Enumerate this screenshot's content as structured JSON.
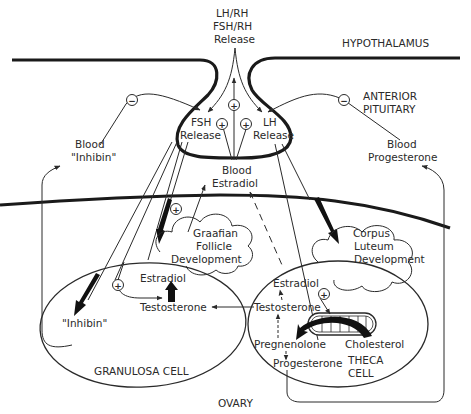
{
  "diagram": {
    "regions": {
      "hypothalamus": "HYPOTHALAMUS",
      "anterior_pituitary_line1": "ANTERIOR",
      "anterior_pituitary_line2": "PITUITARY",
      "ovary": "OVARY"
    },
    "hypothalamus_release": {
      "line1": "LH/RH",
      "line2": "FSH/RH",
      "line3": "Release"
    },
    "pituitary": {
      "fsh_line1": "FSH",
      "fsh_line2": "Release",
      "lh_line1": "LH",
      "lh_line2": "Release"
    },
    "blood": {
      "inhibin_line1": "Blood",
      "inhibin_line2": "\"Inhibin\"",
      "estradiol_line1": "Blood",
      "estradiol_line2": "Estradiol",
      "progesterone_line1": "Blood",
      "progesterone_line2": "Progesterone"
    },
    "follicle": {
      "line1": "Graafian",
      "line2": "Follicle",
      "line3": "Development"
    },
    "corpus_luteum": {
      "line1": "Corpus",
      "line2": "Luteum",
      "line3": "Development"
    },
    "granulosa_cell": {
      "label": "GRANULOSA CELL",
      "estradiol": "Estradiol",
      "testosterone": "Testosterone",
      "inhibin": "\"Inhibin\""
    },
    "theca_cell": {
      "label_line1": "THECA",
      "label_line2": "CELL",
      "estradiol": "Estradiol",
      "testosterone": "Testosterone",
      "pregnenolone": "Pregnenolone",
      "cholesterol": "Cholesterol",
      "progesterone": "Progesterone"
    },
    "signs": {
      "plus": "+",
      "minus": "−"
    },
    "colors": {
      "ink": "#2a2a2a",
      "background": "#ffffff"
    }
  }
}
